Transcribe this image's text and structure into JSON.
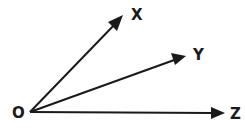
{
  "diagram": {
    "type": "angle-rays",
    "origin": {
      "label": "O",
      "x": 30,
      "y": 112
    },
    "rays": [
      {
        "label": "X",
        "tip": {
          "x": 123,
          "y": 15
        },
        "label_pos": {
          "x": 131,
          "y": 20
        }
      },
      {
        "label": "Y",
        "tip": {
          "x": 186,
          "y": 56
        },
        "label_pos": {
          "x": 193,
          "y": 60
        }
      },
      {
        "label": "Z",
        "tip": {
          "x": 224,
          "y": 113
        },
        "label_pos": {
          "x": 230,
          "y": 119
        }
      }
    ],
    "colors": {
      "line": "#1a1a1a",
      "background": "#ffffff"
    }
  }
}
